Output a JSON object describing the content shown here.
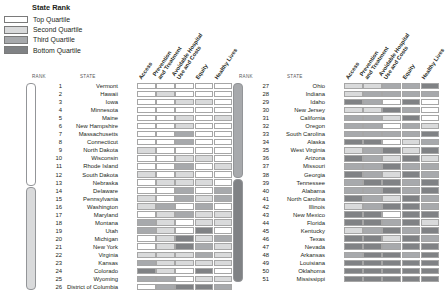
{
  "legend": {
    "title": "State Rank",
    "items": [
      {
        "label": "Top Quartile",
        "color": "#ffffff",
        "class": "q1"
      },
      {
        "label": "Second Quartile",
        "color": "#d9dadb",
        "class": "q2"
      },
      {
        "label": "Third Quartile",
        "color": "#a7a9ac",
        "class": "q3"
      },
      {
        "label": "Bottom Quartile",
        "color": "#808285",
        "class": "q4"
      }
    ]
  },
  "columns": {
    "rank_header": "RANK",
    "state_header": "STATE",
    "dimensions": [
      "Access",
      "Prevention\nand Treatment",
      "Avoidable Hospital\nUse and Costs",
      "Equity",
      "Healthy Lives"
    ]
  },
  "chart_data": {
    "type": "heatmap",
    "title": "State Rank",
    "xlabel": "",
    "ylabel": "",
    "categories": [
      "Access",
      "Prevention and Treatment",
      "Avoidable Hospital Use and Costs",
      "Equity",
      "Healthy Lives"
    ],
    "value_scale": {
      "1": "Top Quartile",
      "2": "Second Quartile",
      "3": "Third Quartile",
      "4": "Bottom Quartile"
    },
    "legend_position": "top-left",
    "grid": true,
    "panels": [
      {
        "name": "ranks-1-26",
        "rows": [
          {
            "rank": 1,
            "state": "Vermont",
            "values": [
              1,
              1,
              1,
              1,
              1
            ]
          },
          {
            "rank": 2,
            "state": "Hawaii",
            "values": [
              1,
              2,
              1,
              1,
              1
            ]
          },
          {
            "rank": 3,
            "state": "Iowa",
            "values": [
              1,
              1,
              2,
              2,
              1
            ]
          },
          {
            "rank": 4,
            "state": "Minnesota",
            "values": [
              1,
              1,
              1,
              1,
              1
            ]
          },
          {
            "rank": 5,
            "state": "Maine",
            "values": [
              1,
              1,
              2,
              1,
              2
            ]
          },
          {
            "rank": 6,
            "state": "New Hampshire",
            "values": [
              1,
              1,
              2,
              1,
              1
            ]
          },
          {
            "rank": 7,
            "state": "Massachusetts",
            "values": [
              1,
              1,
              3,
              1,
              1
            ]
          },
          {
            "rank": 8,
            "state": "Connecticut",
            "values": [
              1,
              1,
              3,
              1,
              1
            ]
          },
          {
            "rank": 9,
            "state": "North Dakota",
            "values": [
              2,
              1,
              1,
              1,
              1
            ]
          },
          {
            "rank": 10,
            "state": "Wisconsin",
            "values": [
              1,
              1,
              2,
              2,
              1
            ]
          },
          {
            "rank": 11,
            "state": "Rhode Island",
            "values": [
              1,
              1,
              3,
              1,
              2
            ]
          },
          {
            "rank": 12,
            "state": "South Dakota",
            "values": [
              2,
              1,
              2,
              1,
              1
            ]
          },
          {
            "rank": 13,
            "state": "Nebraska",
            "values": [
              1,
              2,
              2,
              2,
              1
            ]
          },
          {
            "rank": 14,
            "state": "Delaware",
            "values": [
              1,
              1,
              3,
              1,
              3
            ]
          },
          {
            "rank": 15,
            "state": "Pennsylvania",
            "values": [
              2,
              1,
              3,
              2,
              3
            ]
          },
          {
            "rank": 16,
            "state": "Washington",
            "values": [
              2,
              3,
              1,
              3,
              1
            ]
          },
          {
            "rank": 17,
            "state": "Maryland",
            "values": [
              1,
              2,
              3,
              2,
              2
            ]
          },
          {
            "rank": 18,
            "state": "Montana",
            "values": [
              3,
              2,
              1,
              2,
              2
            ]
          },
          {
            "rank": 19,
            "state": "Utah",
            "values": [
              3,
              2,
              1,
              4,
              1
            ]
          },
          {
            "rank": 20,
            "state": "Michigan",
            "values": [
              1,
              2,
              4,
              2,
              3
            ]
          },
          {
            "rank": 21,
            "state": "New York",
            "values": [
              1,
              2,
              4,
              3,
              2
            ]
          },
          {
            "rank": 22,
            "state": "Virginia",
            "values": [
              2,
              2,
              2,
              3,
              2
            ]
          },
          {
            "rank": 23,
            "state": "Kansas",
            "values": [
              3,
              2,
              2,
              2,
              2
            ]
          },
          {
            "rank": 24,
            "state": "Colorado",
            "values": [
              4,
              2,
              1,
              4,
              1
            ]
          },
          {
            "rank": 25,
            "state": "Wyoming",
            "values": [
              3,
              3,
              1,
              2,
              2
            ]
          },
          {
            "rank": 26,
            "state": "District of Columbia",
            "values": [
              1,
              3,
              4,
              4,
              3
            ]
          }
        ]
      },
      {
        "name": "ranks-27-51",
        "rows": [
          {
            "rank": 27,
            "state": "Ohio",
            "values": [
              2,
              2,
              3,
              3,
              4
            ]
          },
          {
            "rank": 28,
            "state": "Indiana",
            "values": [
              2,
              3,
              3,
              3,
              3
            ]
          },
          {
            "rank": 29,
            "state": "Idaho",
            "values": [
              4,
              3,
              1,
              4,
              1
            ]
          },
          {
            "rank": 30,
            "state": "New Jersey",
            "values": [
              2,
              2,
              4,
              3,
              1
            ]
          },
          {
            "rank": 31,
            "state": "California",
            "values": [
              3,
              3,
              2,
              4,
              1
            ]
          },
          {
            "rank": 32,
            "state": "Oregon",
            "values": [
              3,
              3,
              1,
              3,
              2
            ]
          },
          {
            "rank": 33,
            "state": "South Carolina",
            "values": [
              3,
              3,
              3,
              3,
              4
            ]
          },
          {
            "rank": 34,
            "state": "Alaska",
            "values": [
              4,
              4,
              1,
              2,
              3
            ]
          },
          {
            "rank": 35,
            "state": "West Virginia",
            "values": [
              2,
              3,
              4,
              2,
              4
            ]
          },
          {
            "rank": 36,
            "state": "Arizona",
            "values": [
              4,
              3,
              2,
              4,
              2
            ]
          },
          {
            "rank": 37,
            "state": "Missouri",
            "values": [
              3,
              3,
              4,
              3,
              3
            ]
          },
          {
            "rank": 38,
            "state": "Georgia",
            "values": [
              4,
              3,
              2,
              4,
              3
            ]
          },
          {
            "rank": 39,
            "state": "Tennessee",
            "values": [
              3,
              4,
              4,
              3,
              4
            ]
          },
          {
            "rank": 40,
            "state": "Alabama",
            "values": [
              3,
              3,
              4,
              3,
              4
            ]
          },
          {
            "rank": 41,
            "state": "North Carolina",
            "values": [
              4,
              3,
              2,
              4,
              3
            ]
          },
          {
            "rank": 42,
            "state": "Illinois",
            "values": [
              2,
              3,
              4,
              4,
              3
            ]
          },
          {
            "rank": 43,
            "state": "New Mexico",
            "values": [
              4,
              4,
              1,
              4,
              4
            ]
          },
          {
            "rank": 44,
            "state": "Florida",
            "values": [
              4,
              4,
              3,
              4,
              2
            ]
          },
          {
            "rank": 45,
            "state": "Kentucky",
            "values": [
              2,
              3,
              4,
              3,
              4
            ]
          },
          {
            "rank": 46,
            "state": "Texas",
            "values": [
              4,
              4,
              2,
              4,
              3
            ]
          },
          {
            "rank": 47,
            "state": "Nevada",
            "values": [
              4,
              4,
              3,
              4,
              4
            ]
          },
          {
            "rank": 48,
            "state": "Arkansas",
            "values": [
              3,
              4,
              4,
              3,
              4
            ]
          },
          {
            "rank": 49,
            "state": "Louisiana",
            "values": [
              4,
              4,
              4,
              4,
              4
            ]
          },
          {
            "rank": 50,
            "state": "Oklahoma",
            "values": [
              4,
              4,
              4,
              4,
              4
            ]
          },
          {
            "rank": 51,
            "state": "Mississippi",
            "values": [
              4,
              4,
              4,
              4,
              4
            ]
          }
        ]
      }
    ],
    "brackets": [
      {
        "panel": 0,
        "quartile": 1,
        "class": "b-q1",
        "from_rank": 1,
        "to_rank": 13
      },
      {
        "panel": 0,
        "quartile": 2,
        "class": "b-q2",
        "from_rank": 14,
        "to_rank": 26
      },
      {
        "panel": 1,
        "quartile": 3,
        "class": "b-q3",
        "from_rank": 27,
        "to_rank": 38
      },
      {
        "panel": 1,
        "quartile": 4,
        "class": "b-q4",
        "from_rank": 39,
        "to_rank": 51
      }
    ]
  }
}
